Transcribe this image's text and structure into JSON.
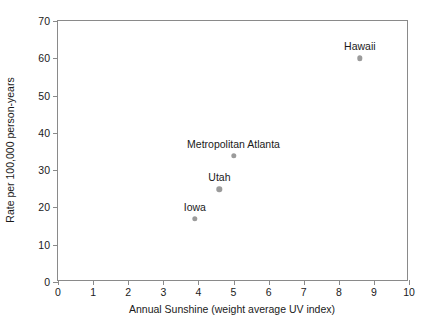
{
  "chart_data": {
    "type": "scatter",
    "title": "",
    "xlabel": "Annual Sunshine (weight average UV index)",
    "ylabel": "Rate per 100,000 person-years",
    "xlim": [
      0,
      10
    ],
    "ylim": [
      0,
      70
    ],
    "xticks": [
      "0",
      "1",
      "2",
      "3",
      "4",
      "5",
      "6",
      "7",
      "8",
      "9",
      "10"
    ],
    "yticks": [
      "0",
      "10",
      "20",
      "30",
      "40",
      "50",
      "60",
      "70"
    ],
    "grid": false,
    "legend": "none",
    "marker_color": "#9b9b9b",
    "axis_color": "#8a8a8a",
    "points": [
      {
        "label": "Iowa",
        "x": 3.9,
        "y": 16.9
      },
      {
        "label": "Utah",
        "x": 4.6,
        "y": 24.9
      },
      {
        "label": "Metropolitan Atlanta",
        "x": 5.0,
        "y": 33.8
      },
      {
        "label": "Hawaii",
        "x": 8.6,
        "y": 60.0
      }
    ]
  }
}
